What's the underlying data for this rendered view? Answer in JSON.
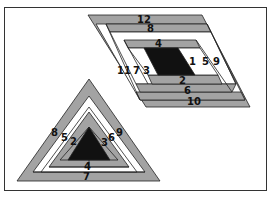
{
  "colors": {
    "gray": "#a3a3a3",
    "white": "#ffffff",
    "black": "#111111",
    "stroke": "#222222"
  },
  "parallelogram": {
    "labels": {
      "l1": "1",
      "l2": "2",
      "l3": "3",
      "l4": "4",
      "l5": "5",
      "l6": "6",
      "l7": "7",
      "l8": "8",
      "l9": "9",
      "l10": "10",
      "l11": "11",
      "l12": "12"
    }
  },
  "triangle": {
    "labels": {
      "l1": "1",
      "l2": "2",
      "l3": "3",
      "l4": "4",
      "l5": "5",
      "l6": "6",
      "l7": "7",
      "l8": "8",
      "l9": "9"
    }
  }
}
